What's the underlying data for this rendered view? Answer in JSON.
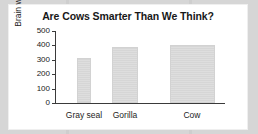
{
  "chart_data": {
    "type": "bar",
    "title": "Are Cows Smarter Than We Think?",
    "xlabel": "",
    "ylabel": "Brain weight (g)",
    "categories": [
      "Gray seal",
      "Gorilla",
      "Cow"
    ],
    "values": [
      310,
      390,
      400
    ],
    "ylim": [
      0,
      500
    ],
    "yticks": [
      "0",
      "100",
      "200",
      "300",
      "400",
      "500"
    ],
    "grid": false,
    "legend": "none",
    "bar_color": "#dcdcdc",
    "axis_color": "#3a3a3a",
    "title_color": "#181818",
    "panel_color": "#ffffff",
    "background_color": "#d6d6d6"
  },
  "bars": [
    {
      "category": "Gray seal",
      "value": 310,
      "left_px": 22,
      "width_px": 14
    },
    {
      "category": "Gorilla",
      "value": 390,
      "left_px": 57,
      "width_px": 26
    },
    {
      "category": "Cow",
      "value": 400,
      "left_px": 115,
      "width_px": 45
    }
  ],
  "labels": [
    {
      "text": "Gray seal",
      "left_px": 5,
      "width_px": 48
    },
    {
      "text": "Gorilla",
      "left_px": 47,
      "width_px": 46
    },
    {
      "text": "Cow",
      "left_px": 113,
      "width_px": 48
    }
  ],
  "yaxis": {
    "ticks": [
      {
        "label": "500",
        "top_px": 5
      },
      {
        "label": "400",
        "top_px": 19.4
      },
      {
        "label": "300",
        "top_px": 33.8
      },
      {
        "label": "200",
        "top_px": 48.2
      },
      {
        "label": "100",
        "top_px": 62.6
      },
      {
        "label": "0",
        "top_px": 77
      }
    ]
  }
}
